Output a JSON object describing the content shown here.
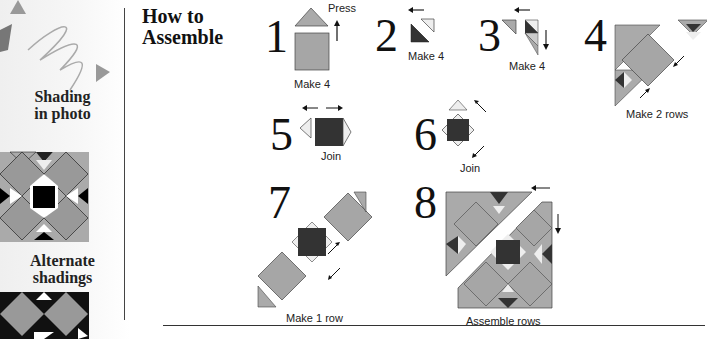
{
  "sidebar": {
    "shading_label_line1": "Shading",
    "shading_label_line2": "in photo",
    "alternate_label_line1": "Alternate",
    "alternate_label_line2": "shadings"
  },
  "header": {
    "title_line1": "How to",
    "title_line2": "Assemble"
  },
  "steps": [
    {
      "number": "1",
      "caption": "Make 4",
      "note": "Press"
    },
    {
      "number": "2",
      "caption": "Make 4"
    },
    {
      "number": "3",
      "caption": "Make 4"
    },
    {
      "number": "4",
      "caption": "Make 2 rows"
    },
    {
      "number": "5",
      "caption": "Join"
    },
    {
      "number": "6",
      "caption": "Join"
    },
    {
      "number": "7",
      "caption": "Make 1 row"
    },
    {
      "number": "8",
      "caption": "Assemble rows"
    }
  ],
  "colors": {
    "medium": "#a9a9a9",
    "light": "#e8e8e8",
    "dark": "#333333",
    "outline": "#222222"
  }
}
